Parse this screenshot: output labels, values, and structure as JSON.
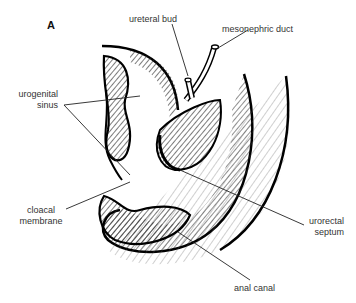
{
  "figure": {
    "panel_label": "A"
  },
  "labels": {
    "ureteral_bud": "ureteral bud",
    "mesonephric_duct": "mesonephric duct",
    "urogenital_sinus_line1": "urogenital",
    "urogenital_sinus_line2": "sinus",
    "cloacal_membrane_line1": "cloacal",
    "cloacal_membrane_line2": "membrane",
    "urorectal_septum_line1": "urorectal",
    "urorectal_septum_line2": "septum",
    "anal_canal": "anal canal"
  }
}
